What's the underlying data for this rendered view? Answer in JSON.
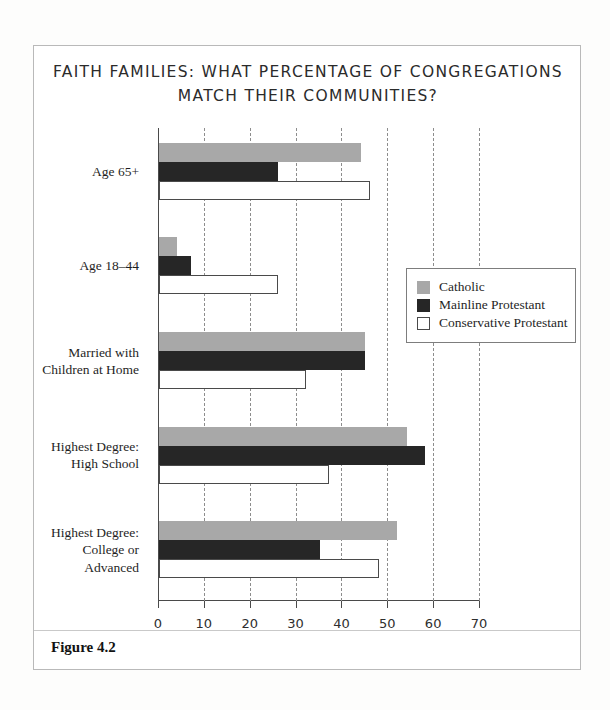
{
  "figure": {
    "caption": "Figure 4.2",
    "title_line1": "FAITH FAMILIES: WHAT PERCENTAGE OF CONGREGATIONS",
    "title_line2": "MATCH THEIR COMMUNITIES?"
  },
  "colors": {
    "catholic": "#a8a8a8",
    "mainline": "#262626",
    "conservative": "#ffffff",
    "outline": "#4a4a4a",
    "grid": "#8d8d8d",
    "border": "#b9b9b9"
  },
  "chart_data": {
    "type": "bar",
    "orientation": "horizontal",
    "title": "FAITH FAMILIES: WHAT PERCENTAGE OF CONGREGATIONS MATCH THEIR COMMUNITIES?",
    "xlabel": "",
    "ylabel": "",
    "xlim": [
      0,
      70
    ],
    "xticks": [
      0,
      10,
      20,
      30,
      40,
      50,
      60,
      70
    ],
    "xtick_labels": [
      "0",
      "10",
      "20",
      "30",
      "40",
      "50",
      "60",
      "70"
    ],
    "grid": "vertical-dashed",
    "legend_position": "center-right",
    "categories": [
      "Age 65+",
      "Age 18–44",
      "Married with Children at Home",
      "Highest Degree: High School",
      "Highest Degree: College or Advanced"
    ],
    "category_lines": [
      [
        "Age 65+"
      ],
      [
        "Age 18–44"
      ],
      [
        "Married with",
        "Children at Home"
      ],
      [
        "Highest Degree:",
        "High School"
      ],
      [
        "Highest Degree:",
        "College or",
        "Advanced"
      ]
    ],
    "series": [
      {
        "name": "Catholic",
        "color": "#a8a8a8",
        "values": [
          44,
          4,
          45,
          54,
          52
        ]
      },
      {
        "name": "Mainline Protestant",
        "color": "#262626",
        "values": [
          26,
          7,
          45,
          58,
          35
        ]
      },
      {
        "name": "Conservative Protestant",
        "color": "#ffffff",
        "values": [
          46,
          26,
          32,
          37,
          48
        ]
      }
    ],
    "legend": [
      "Catholic",
      "Mainline Protestant",
      "Conservative Protestant"
    ]
  }
}
